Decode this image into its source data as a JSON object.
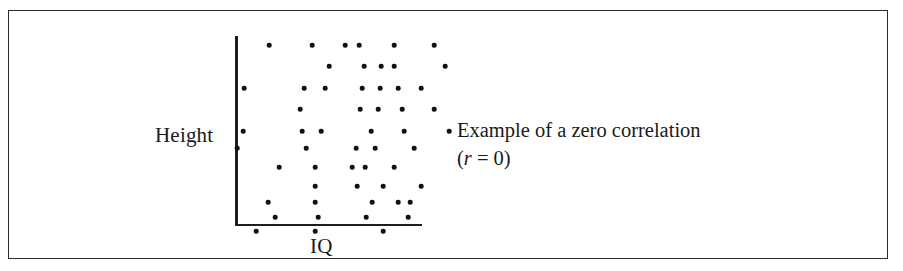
{
  "figure": {
    "border_color": "#2b2b2b",
    "background_color": "#ffffff"
  },
  "annotation": {
    "line1": "Example of a zero  correlation",
    "line2_open": "(",
    "line2_variable": "r",
    "line2_rest": " = 0)"
  },
  "chart_data": {
    "type": "scatter",
    "title": "",
    "xlabel": "IQ",
    "ylabel": "Height",
    "grid": false,
    "legend": null,
    "axis_style": "two-sided L-shaped axis, no tick marks, no tick labels",
    "annotation_text": "Example of a zero  correlation (r = 0)",
    "correlation_r": 0,
    "point_color": "#111111",
    "n_points": 60,
    "xlim": [
      0,
      188
    ],
    "ylim": [
      0,
      190
    ],
    "points": [
      [
        34,
        9
      ],
      [
        77,
        9
      ],
      [
        110,
        9
      ],
      [
        124,
        9
      ],
      [
        159,
        9
      ],
      [
        199,
        9
      ],
      [
        94,
        30
      ],
      [
        129,
        30
      ],
      [
        146,
        30
      ],
      [
        159,
        30
      ],
      [
        210,
        30
      ],
      [
        9,
        52
      ],
      [
        69,
        52
      ],
      [
        90,
        52
      ],
      [
        127,
        52
      ],
      [
        145,
        52
      ],
      [
        163,
        52
      ],
      [
        186,
        52
      ],
      [
        65,
        73
      ],
      [
        125,
        73
      ],
      [
        143,
        73
      ],
      [
        167,
        73
      ],
      [
        199,
        73
      ],
      [
        8,
        95
      ],
      [
        67,
        95
      ],
      [
        86,
        95
      ],
      [
        136,
        95
      ],
      [
        169,
        95
      ],
      [
        214,
        95
      ],
      [
        2,
        112
      ],
      [
        71,
        112
      ],
      [
        121,
        112
      ],
      [
        140,
        112
      ],
      [
        179,
        112
      ],
      [
        44,
        131
      ],
      [
        80,
        131
      ],
      [
        117,
        131
      ],
      [
        130,
        131
      ],
      [
        159,
        131
      ],
      [
        80,
        150
      ],
      [
        122,
        150
      ],
      [
        148,
        150
      ],
      [
        186,
        150
      ],
      [
        33,
        166
      ],
      [
        80,
        166
      ],
      [
        137,
        166
      ],
      [
        163,
        166
      ],
      [
        175,
        166
      ],
      [
        40,
        181
      ],
      [
        83,
        181
      ],
      [
        131,
        181
      ],
      [
        173,
        181
      ],
      [
        21,
        195
      ],
      [
        80,
        195
      ],
      [
        148,
        195
      ]
    ]
  }
}
